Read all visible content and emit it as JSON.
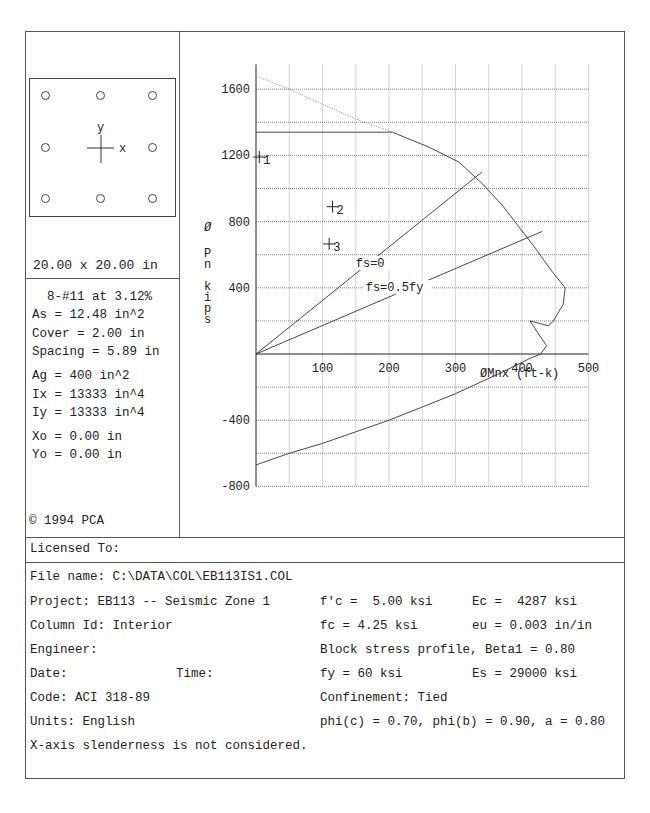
{
  "section": {
    "dimensions": "20.00 x 20.00 in",
    "axis_labels": {
      "x": "x",
      "y": "y"
    },
    "bars_count": 8
  },
  "properties": {
    "bars": "8-#11 at 3.12%",
    "as": "As = 12.48 in^2",
    "cover": "Cover = 2.00 in",
    "spacing": "Spacing = 5.89 in",
    "ag": "Ag = 400 in^2",
    "ix": "Ix = 13333 in^4",
    "iy": "Iy = 13333 in^4",
    "xo": "Xo = 0.00 in",
    "yo": "Yo = 0.00 in"
  },
  "copyright": "© 1994 PCA",
  "licensed_to": "Licensed To:",
  "info_left": {
    "file_name": "File name: C:\\DATA\\COL\\EB113IS1.COL",
    "project": "Project: EB113 -- Seismic Zone 1",
    "column_id": "Column Id: Interior",
    "engineer": "Engineer:",
    "date": "Date:",
    "time": "Time:",
    "code": "Code: ACI 318-89",
    "units": "Units: English",
    "slenderness": "X-axis slenderness is not considered."
  },
  "info_right": {
    "fpc": "f'c =  5.00 ksi",
    "ec": "Ec =  4287 ksi",
    "fc": "fc = 4.25 ksi",
    "eu": "eu = 0.003 in/in",
    "block": "Block stress profile, Beta1 = 0.80",
    "fy": "fy = 60 ksi",
    "es": "Es = 29000 ksi",
    "confinement": "Confinement: Tied",
    "phi": "phi(c) = 0.70, phi(b) = 0.90, a = 0.80"
  },
  "chart_data": {
    "type": "line",
    "title": "",
    "xlabel": "ØMnx (ft-k)",
    "ylabel": "Ø Pn kips",
    "xlim": [
      0,
      500
    ],
    "ylim": [
      -800,
      1750
    ],
    "x_ticks": [
      100,
      200,
      300,
      400,
      500
    ],
    "y_ticks": [
      -800,
      -400,
      400,
      800,
      1200,
      1600
    ],
    "grid": true,
    "series": [
      {
        "name": "Interaction diagram (design)",
        "style": "solid",
        "points": [
          [
            0,
            1340
          ],
          [
            205,
            1340
          ],
          [
            260,
            1250
          ],
          [
            305,
            1160
          ],
          [
            340,
            1030
          ],
          [
            370,
            900
          ],
          [
            395,
            770
          ],
          [
            420,
            640
          ],
          [
            445,
            500
          ],
          [
            465,
            400
          ],
          [
            462,
            300
          ],
          [
            447,
            200
          ],
          [
            440,
            170
          ],
          [
            412,
            200
          ],
          [
            425,
            120
          ],
          [
            437,
            50
          ],
          [
            428,
            0
          ],
          [
            410,
            -30
          ],
          [
            370,
            -110
          ],
          [
            300,
            -240
          ],
          [
            250,
            -320
          ],
          [
            200,
            -400
          ],
          [
            150,
            -470
          ],
          [
            100,
            -540
          ],
          [
            50,
            -600
          ],
          [
            0,
            -670
          ]
        ]
      },
      {
        "name": "Nominal max axial (unreduced)",
        "style": "dotted",
        "points": [
          [
            0,
            1680
          ],
          [
            50,
            1600
          ],
          [
            100,
            1510
          ],
          [
            150,
            1420
          ],
          [
            205,
            1340
          ]
        ]
      },
      {
        "name": "fs=0",
        "style": "solid",
        "points": [
          [
            0,
            0
          ],
          [
            340,
            1100
          ]
        ]
      },
      {
        "name": "fs=0.5fy",
        "style": "solid",
        "points": [
          [
            0,
            0
          ],
          [
            430,
            740
          ]
        ]
      }
    ],
    "load_points": [
      {
        "label": "1",
        "x": 5,
        "y": 1190
      },
      {
        "label": "2",
        "x": 115,
        "y": 890
      },
      {
        "label": "3",
        "x": 110,
        "y": 665
      }
    ],
    "annotations": [
      "fs=0",
      "fs=0.5fy"
    ]
  }
}
